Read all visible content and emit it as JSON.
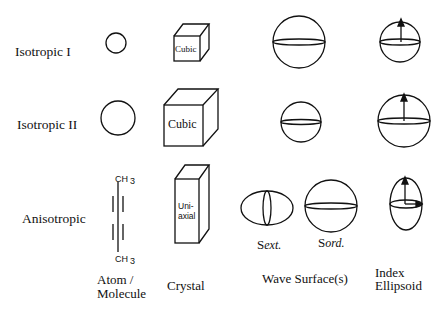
{
  "rows": [
    {
      "label": "Isotropic I"
    },
    {
      "label": "Isotropic II"
    },
    {
      "label": "Anisotropic"
    }
  ],
  "columns": [
    {
      "label_line1": "Atom /",
      "label_line2": "Molecule"
    },
    {
      "label": "Crystal"
    },
    {
      "label": "Wave Surface(s)"
    },
    {
      "label_line1": "Index",
      "label_line2": "Ellipsoid"
    }
  ],
  "crystal_labels": {
    "row1": "Cubic",
    "row2": "Cubic",
    "row3_line1": "Uni-",
    "row3_line2": "axial"
  },
  "molecule": {
    "top": "CH",
    "top_sub": "3",
    "bottom": "CH",
    "bottom_sub": "3"
  },
  "wave_surface_labels": {
    "ext_s": "S",
    "ext": "ext.",
    "ord_s": "S",
    "ord": "ord."
  }
}
